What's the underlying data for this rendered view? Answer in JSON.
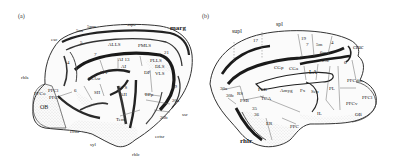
{
  "figure": {
    "panel_a": {
      "tag": "(a)",
      "labels": {
        "marg": "marg",
        "ssps": "ssps",
        "esc": "esc",
        "aa": "5aa",
        "sps": "5pm",
        "rhls": "rhls",
        "rhlc": "rhlc",
        "ectsr": "ectsr",
        "ectsr2": "ectsr",
        "sss": "sss",
        "ssr": "ssr",
        "syl": "syl",
        "OB": "OB",
        "AI13": "AI 13",
        "AI": "AI",
        "AII": "AII",
        "AIS": "AI S",
        "DP": "DP",
        "DLS": "DLS",
        "VLS": "VLS",
        "PMLS": "PMLS",
        "PLLS": "PLLS",
        "ALLS": "ALLS",
        "SIV": "SIV",
        "SII": "SII",
        "SIAsr": "S1Asr",
        "Tem": "Tem",
        "n19": "19",
        "n20a": "20a",
        "n20b": "20b",
        "n21": "21",
        "n7": "7",
        "n5": "5",
        "n4": "4",
        "n6": "6",
        "PFCo": "PFCo",
        "PFCl": "PFCl",
        "PFCv": "PFCv",
        "EPp": "EPp"
      }
    },
    "panel_b": {
      "tag": "(b)",
      "labels": {
        "supl": "supl",
        "spl": "spl",
        "cruc": "cruc",
        "rhlr": "rhlr",
        "n17": "17",
        "n18": "18",
        "n19": "19",
        "n7": "7",
        "n35": "35",
        "n36": "36",
        "n5m": "5m",
        "n6m": "6m",
        "n4": "4",
        "n29b": "29b",
        "n29c": "29c",
        "n6": "6",
        "RS": "RS",
        "PSB": "PSB",
        "PSB2": "PSB",
        "TCA": "TCA",
        "CGp": "CGp",
        "CGa": "CGa",
        "LA": "LA",
        "PL": "PL",
        "IL": "IL",
        "ER": "ER",
        "PPC": "PPC",
        "Amyg": "Amyg",
        "Fx": "Fx",
        "Sep": "Sep",
        "PFCdm": "PFCdm",
        "PFCv": "PFCv",
        "PFCl": "PFCl",
        "OB": "OB",
        "n30a": "30a",
        "n30b": "30b"
      }
    }
  }
}
